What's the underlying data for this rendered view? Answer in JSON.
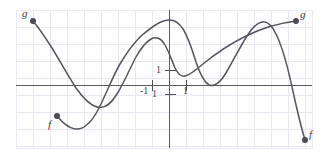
{
  "figure": {
    "kind": "math-function-graph",
    "width": 328,
    "height": 160,
    "background": "#ffffff",
    "grid_color": "#e8e6ef",
    "frame_color": "#efedf4",
    "axis_color": "#5a5a63",
    "curve_color": "#55555f",
    "point_color": "#4a4a53",
    "label_color": "#3a3a40"
  },
  "axes": {
    "x_axis_label": "",
    "y_axis_label": "",
    "ticks": [
      {
        "name": "y-tick-1",
        "text": "1",
        "x": 156,
        "y": 68
      },
      {
        "name": "x-tick-neg1",
        "text": "-1",
        "x": 140,
        "y": 88
      },
      {
        "name": "x-tick-1-origin",
        "text": "1",
        "x": 152,
        "y": 91
      },
      {
        "name": "x-tick-1",
        "text": "1",
        "x": 178,
        "y": 88
      }
    ]
  },
  "curves": [
    {
      "name": "curve-f",
      "label": "f",
      "color": "#55555f",
      "path": "M 57 116 C 62 122, 68 128, 75 129 C 84 130, 92 122, 99 108 C 107 92, 113 76, 120 64 C 127 52, 134 43, 141 36 C 147 31, 152 27, 157 24 C 162 21, 166 20, 170 20 C 175 20, 179 23, 183 29 C 188 37, 192 49, 196 62 C 200 74, 204 82, 209 85 C 214 87, 220 83, 226 73 C 233 61, 240 47, 247 36 C 252 28, 257 23, 262 22 C 267 21, 272 25, 277 36 C 283 49, 289 72, 294 96 C 298 114, 302 130, 305 140"
    },
    {
      "name": "curve-g",
      "label": "g",
      "color": "#55555f",
      "path": "M 33 21 C 38 27, 45 37, 52 48 C 60 61, 68 76, 76 88 C 83 98, 90 105, 97 107 C 104 109, 111 104, 117 94 C 124 83, 130 68, 136 57 C 141 48, 146 42, 151 39 C 156 36, 161 38, 165 45 C 169 52, 172 61, 175 68 C 178 74, 181 77, 185 76 C 190 75, 196 70, 203 64 C 215 54, 230 44, 246 36 C 262 28, 280 23, 296 21"
    }
  ],
  "endpoints": [
    {
      "name": "endpoint-g-left",
      "label": "g",
      "cx": 33,
      "cy": 21,
      "label_x": 22,
      "label_y": 8
    },
    {
      "name": "endpoint-f-left",
      "label": "f",
      "cx": 57,
      "cy": 116,
      "label_x": 48,
      "label_y": 120
    },
    {
      "name": "endpoint-g-right",
      "label": "g",
      "cx": 296,
      "cy": 21,
      "label_x": 300,
      "label_y": 9
    },
    {
      "name": "endpoint-f-right",
      "label": "f",
      "cx": 305,
      "cy": 140,
      "label_x": 309,
      "label_y": 130
    }
  ],
  "chart_data": {
    "type": "line",
    "title": "",
    "xlabel": "",
    "ylabel": "",
    "grid": true,
    "legend": "inline-endpoint-labels",
    "xlim": [
      -8,
      8
    ],
    "ylim": [
      -4,
      4
    ],
    "xticks": [
      -1,
      1
    ],
    "yticks": [
      -1,
      1
    ],
    "series": [
      {
        "name": "f",
        "color": "#55555f",
        "x": [
          -7.0,
          -6.0,
          -5.0,
          -4.0,
          -3.0,
          -2.2,
          -1.5,
          -1.0,
          -0.5,
          0.0,
          0.5,
          1.0,
          1.5,
          2.0,
          2.5,
          3.0,
          3.5,
          4.0,
          4.5,
          5.0,
          5.5,
          6.0,
          6.5,
          7.0,
          7.5,
          8.0
        ],
        "y": [
          -1.7,
          -2.0,
          -1.9,
          -1.2,
          0.1,
          1.2,
          2.1,
          2.7,
          3.1,
          3.4,
          3.5,
          3.2,
          2.5,
          1.5,
          0.6,
          0.1,
          0.3,
          1.1,
          2.2,
          3.0,
          3.4,
          3.3,
          2.4,
          0.9,
          -1.1,
          -2.9
        ]
      },
      {
        "name": "g",
        "color": "#55555f",
        "x": [
          -8.0,
          -7.0,
          -6.0,
          -5.0,
          -4.0,
          -3.0,
          -2.0,
          -1.5,
          -1.0,
          -0.5,
          0.0,
          0.5,
          1.0,
          1.5,
          2.0,
          3.0,
          4.0,
          5.0,
          6.0,
          7.0,
          8.0
        ],
        "y": [
          3.4,
          2.4,
          1.1,
          -0.4,
          -1.3,
          -1.5,
          -0.7,
          0.2,
          1.0,
          1.8,
          2.3,
          2.0,
          1.4,
          1.1,
          1.3,
          1.8,
          2.2,
          2.6,
          2.9,
          3.1,
          3.3
        ]
      }
    ]
  }
}
